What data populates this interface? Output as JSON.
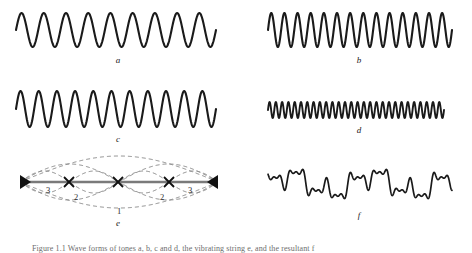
{
  "figure": {
    "background_color": "#ffffff",
    "stroke_color": "#1a1a1a",
    "dashed_color": "#8a8a8a",
    "axis_color": "#7a7a7a",
    "width": 472,
    "height": 252
  },
  "panels": [
    {
      "id": "a",
      "label": "a",
      "kind": "sine-wave",
      "cycles": 9,
      "amplitude": 17,
      "description": "fundamental tone waveform, lowest frequency"
    },
    {
      "id": "b",
      "label": "b",
      "kind": "sine-wave",
      "cycles": 14,
      "amplitude": 17,
      "description": "second tone waveform, higher frequency"
    },
    {
      "id": "c",
      "label": "c",
      "kind": "sine-wave",
      "cycles": 11,
      "amplitude": 18,
      "description": "third tone waveform"
    },
    {
      "id": "d",
      "label": "d",
      "kind": "sine-wave",
      "cycles": 28,
      "amplitude": 8,
      "description": "fourth tone waveform, highest frequency, small amplitude"
    },
    {
      "id": "e",
      "label": "e",
      "kind": "standing-wave-modes",
      "description": "vibrating string with nodes showing harmonic modes 1, 2 and 3",
      "node_count": 5,
      "mode_labels": [
        "3",
        "2",
        "1",
        "2",
        "3"
      ]
    },
    {
      "id": "f",
      "label": "f",
      "kind": "complex-wave",
      "description": "resultant complex waveform from superposition of the tones"
    }
  ],
  "caption": {
    "text": "Figure 1.1  Wave forms of tones a, b, c and d, the vibrating string e, and the resultant f"
  },
  "chart_data": {
    "type": "line",
    "xlabel": "",
    "ylabel": "",
    "grid": false,
    "legend": "none",
    "series": [
      {
        "name": "a",
        "waveform": "sine",
        "cycles": 9,
        "amplitude": 17,
        "x_range": [
          16,
          216
        ]
      },
      {
        "name": "b",
        "waveform": "sine",
        "cycles": 14,
        "amplitude": 17,
        "x_range": [
          268,
          452
        ]
      },
      {
        "name": "c",
        "waveform": "sine",
        "cycles": 11,
        "amplitude": 18,
        "x_range": [
          16,
          216
        ]
      },
      {
        "name": "d",
        "waveform": "sine",
        "cycles": 28,
        "amplitude": 8,
        "x_range": [
          268,
          444
        ]
      },
      {
        "name": "f",
        "waveform": "sum-of-harmonics",
        "harmonics": [
          1,
          3,
          7,
          11
        ],
        "amplitudes": [
          9,
          7,
          5,
          3
        ],
        "x_range": [
          268,
          452
        ]
      }
    ],
    "string_modes": {
      "x_start": 20,
      "x_end": 218,
      "nodes": [
        20,
        69,
        118,
        169,
        218
      ],
      "modes": [
        {
          "n": 1,
          "label": "1",
          "half_wavelengths": 1
        },
        {
          "n": 2,
          "label": "2",
          "half_wavelengths": 2
        },
        {
          "n": 3,
          "label": "3",
          "half_wavelengths": 4
        }
      ]
    }
  }
}
